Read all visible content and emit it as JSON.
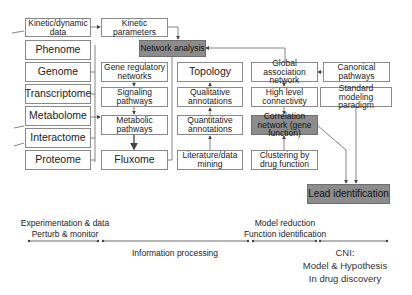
{
  "diagram": {
    "inputs": [
      {
        "id": "kinetic-dynamic-data",
        "label": "Kinetic/dynamic data"
      },
      {
        "id": "phenome",
        "label": "Phenome"
      },
      {
        "id": "genome",
        "label": "Genome"
      },
      {
        "id": "transcriptome",
        "label": "Transcriptome"
      },
      {
        "id": "metabolome",
        "label": "Metabolome"
      },
      {
        "id": "interactome",
        "label": "Interactome"
      },
      {
        "id": "proteome",
        "label": "Proteome"
      }
    ],
    "column2": [
      {
        "id": "kinetic-parameters",
        "label": "Kinetic parameters"
      },
      {
        "id": "gene-regulatory-networks",
        "label": "Gene regulatory networks"
      },
      {
        "id": "signaling-pathways",
        "label": "Signaling pathways"
      },
      {
        "id": "metabolic-pathways",
        "label": "Metabolic pathways"
      },
      {
        "id": "fluxome",
        "label": "Fluxome"
      }
    ],
    "network_analysis": "Network analysis",
    "column3": [
      {
        "id": "topology",
        "label": "Topology"
      },
      {
        "id": "qualitative-annotations",
        "label": "Qualitative annotations"
      },
      {
        "id": "quantitative-annotations",
        "label": "Quantitative annotations"
      },
      {
        "id": "literature-data-mining",
        "label": "Literature/data mining"
      }
    ],
    "column4": [
      {
        "id": "global-association-network",
        "label": "Global association network"
      },
      {
        "id": "high-level-connectivity",
        "label": "High level connectivity"
      },
      {
        "id": "correlation-network",
        "label": "Correlation network (gene function)"
      },
      {
        "id": "clustering",
        "label": "Clustering by drug function"
      }
    ],
    "column5": [
      {
        "id": "canonical-pathways",
        "label": "Canonical pathways"
      },
      {
        "id": "standard-modeling-paradigm",
        "label": "Standard modeling paradigm"
      }
    ],
    "lead_identification": "Lead identification",
    "colors": {
      "box_border": "#8a8a8a",
      "highlight_box": "#8c8c8c",
      "line": "#555555"
    }
  },
  "timeline": {
    "stage1_line1": "Experimentation & data",
    "stage1_line2": "Perturb & monitor",
    "stage2": "Information processing",
    "stage3_line1": "Model reduction",
    "stage3_line2": "Function identification",
    "stage4_line1": "CNI:",
    "stage4_line2": "Model & Hypothesis",
    "stage4_line3": "In drug discovery"
  }
}
